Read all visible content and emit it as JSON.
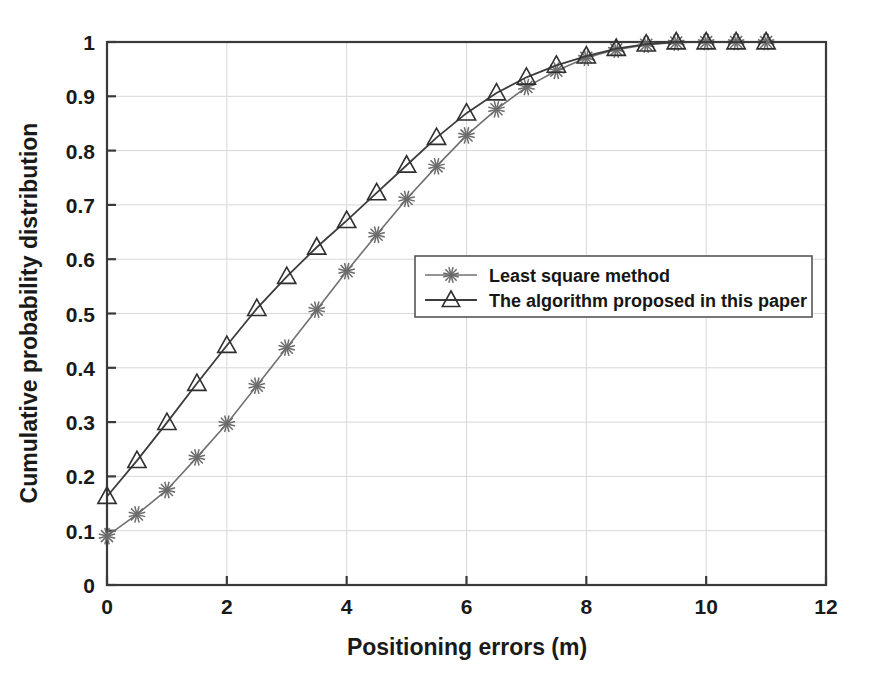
{
  "chart_data": {
    "type": "line",
    "title": "",
    "xlabel": "Positioning errors (m)",
    "ylabel": "Cumulative probability distribution",
    "xlim": [
      0,
      12
    ],
    "ylim": [
      0,
      1
    ],
    "xticks": [
      0,
      2,
      4,
      6,
      8,
      10,
      12
    ],
    "xtick_labels": [
      "0",
      "2",
      "4",
      "6",
      "8",
      "10",
      "12"
    ],
    "yticks": [
      0,
      0.1,
      0.2,
      0.3,
      0.4,
      0.5,
      0.6,
      0.7,
      0.8,
      0.9,
      1
    ],
    "ytick_labels": [
      "0",
      "0.1",
      "0.2",
      "0.3",
      "0.4",
      "0.5",
      "0.6",
      "0.7",
      "0.8",
      "0.9",
      "1"
    ],
    "grid": true,
    "legend_position": "center-right",
    "x": [
      0,
      0.5,
      1,
      1.5,
      2,
      2.5,
      3,
      3.5,
      4,
      4.5,
      5,
      5.5,
      6,
      6.5,
      7,
      7.5,
      8,
      8.5,
      9,
      9.5,
      10,
      10.5,
      11
    ],
    "series": [
      {
        "name": "Least square method",
        "marker": "star",
        "color": "#707070",
        "values": [
          0.09,
          0.13,
          0.175,
          0.235,
          0.297,
          0.367,
          0.437,
          0.507,
          0.578,
          0.645,
          0.711,
          0.771,
          0.828,
          0.876,
          0.917,
          0.947,
          0.971,
          0.986,
          0.995,
          0.999,
          1.0,
          1.0,
          1.0
        ]
      },
      {
        "name": "The algorithm proposed in this paper",
        "marker": "triangle",
        "color": "#3c3c3c",
        "values": [
          0.163,
          0.229,
          0.299,
          0.371,
          0.441,
          0.509,
          0.568,
          0.622,
          0.671,
          0.722,
          0.773,
          0.824,
          0.869,
          0.906,
          0.935,
          0.957,
          0.974,
          0.988,
          0.996,
          1.0,
          1.0,
          1.0,
          1.0
        ]
      }
    ]
  },
  "legend": {
    "entries": [
      {
        "label": "Least square method",
        "marker": "star-marker"
      },
      {
        "label": "The algorithm proposed in this paper",
        "marker": "triangle-marker"
      }
    ]
  },
  "axes": {
    "x_title": "Positioning errors (m)",
    "y_title": "Cumulative probability distribution"
  },
  "colors": {
    "background": "#ffffff",
    "axis": "#3a3a3a",
    "grid": "#d8d8d8",
    "series_a": "#707070",
    "series_b": "#3c3c3c",
    "text": "#1a1a1a"
  }
}
